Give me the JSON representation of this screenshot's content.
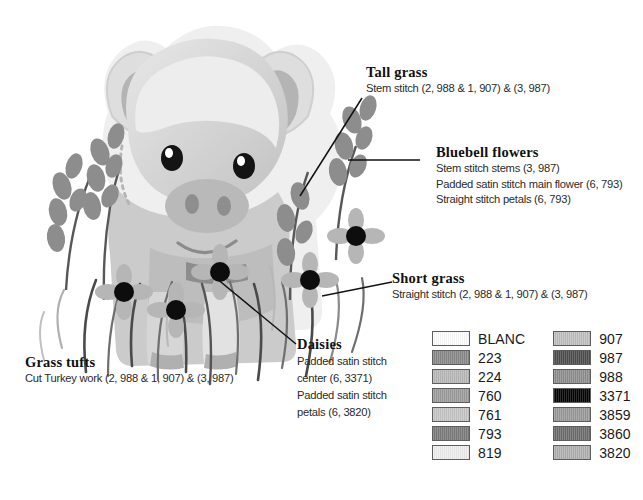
{
  "illustration": {
    "subject": "piglet-in-meadow",
    "alt": "Grayscale illustration of a piglet standing among bluebells, daisies and grass"
  },
  "callouts": [
    {
      "id": "tall-grass",
      "title": "Tall grass",
      "lines": [
        "Stem stitch (2, 988 & 1, 907) & (3, 987)"
      ]
    },
    {
      "id": "bluebell-flowers",
      "title": "Bluebell flowers",
      "lines": [
        "Stem stitch stems (3, 987)",
        "Padded satin stitch main flower  (6, 793)",
        "Straight stitch petals (6, 793)"
      ]
    },
    {
      "id": "short-grass",
      "title": "Short grass",
      "lines": [
        "Straight stitch (2, 988 & 1, 907) & (3, 987)"
      ]
    },
    {
      "id": "daisies",
      "title": "Daisies",
      "lines": [
        "Padded satin stitch center (6, 3371)",
        "Padded satin stitch petals (6, 3820)"
      ]
    },
    {
      "id": "grass-tufts",
      "title": "Grass tufts",
      "lines": [
        "Cut Turkey work (2, 988 & 1, 907) & (3, 987)"
      ]
    }
  ],
  "legend": {
    "columns": [
      {
        "entries": [
          {
            "label": "BLANC",
            "color": "#ffffff"
          },
          {
            "label": "223",
            "color": "#8a8a8a"
          },
          {
            "label": "224",
            "color": "#b9b9b9"
          },
          {
            "label": "760",
            "color": "#9d9d9d"
          },
          {
            "label": "761",
            "color": "#c6c6c6"
          },
          {
            "label": "793",
            "color": "#7c7c7c"
          },
          {
            "label": "819",
            "color": "#efefef"
          }
        ]
      },
      {
        "entries": [
          {
            "label": "907",
            "color": "#c0c0c0"
          },
          {
            "label": "987",
            "color": "#4f4f4f"
          },
          {
            "label": "988",
            "color": "#8f8f8f"
          },
          {
            "label": "3371",
            "color": "#050505"
          },
          {
            "label": "3859",
            "color": "#9a9a9a"
          },
          {
            "label": "3860",
            "color": "#6e6e6e"
          },
          {
            "label": "3820",
            "color": "#b1b1b1"
          }
        ]
      }
    ]
  }
}
